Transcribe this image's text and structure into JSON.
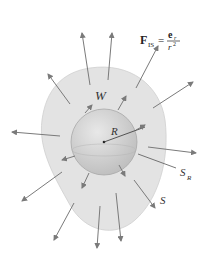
{
  "diagram": {
    "formula": {
      "lhs_main": "F",
      "lhs_sub": "IS",
      "equals": "=",
      "numerator": "e",
      "numerator_sub": "r",
      "denominator": "r",
      "denominator_sup": "2"
    },
    "labels": {
      "region": "W",
      "radius": "R",
      "sphere_surface": "S",
      "sphere_surface_sub": "R",
      "outer_surface": "S"
    },
    "colors": {
      "outer_region": "#e3e3e3",
      "sphere": "#d0d0d0",
      "arrow": "#7a7a7a",
      "text": "#333333"
    }
  }
}
